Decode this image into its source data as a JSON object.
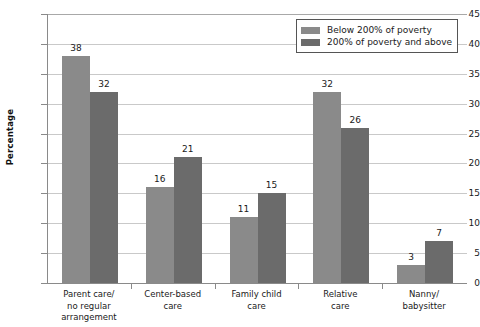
{
  "chart_data": {
    "type": "bar",
    "title": "",
    "xlabel": "",
    "ylabel": "Percentage",
    "ylim": [
      0,
      45
    ],
    "ytick_step": 5,
    "yticks": [
      0,
      5,
      10,
      15,
      20,
      25,
      30,
      35,
      40,
      45
    ],
    "grid": true,
    "legend_position": "top-right",
    "categories": [
      "Parent care/\nno regular\narrangement",
      "Center-based\ncare",
      "Family child\ncare",
      "Relative\ncare",
      "Nanny/\nbabysitter"
    ],
    "series": [
      {
        "name": "Below 200% of poverty",
        "color": "#8a8a8a",
        "values": [
          38,
          16,
          11,
          32,
          3
        ]
      },
      {
        "name": "200% of poverty and above",
        "color": "#6b6b6b",
        "values": [
          32,
          21,
          15,
          26,
          7
        ]
      }
    ]
  },
  "legend": {
    "items": [
      {
        "label": "Below 200% of poverty"
      },
      {
        "label": "200% of poverty and above"
      }
    ]
  },
  "axes": {
    "y_title": "Percentage"
  },
  "title_fragment": ""
}
